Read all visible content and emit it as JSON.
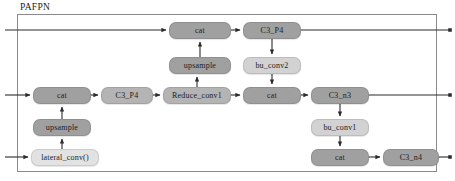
{
  "diagram": {
    "title": "PAFPN",
    "type": "neural-network-architecture",
    "frame": {
      "border_color": "#8a8a8a"
    },
    "palette": {
      "dark": "#a0a0a0",
      "mid": "#b4b4b4",
      "light": "#d2d2d2",
      "pale": "#e2e2e2",
      "wire": "#2b2b2b",
      "text": "#1c1c1c"
    },
    "nodes": [
      {
        "id": "cat_top",
        "label": "cat",
        "tone": "dark",
        "x": 169,
        "y": 22,
        "w": 62,
        "h": 17
      },
      {
        "id": "c3_p4_top",
        "label": "C3_P4",
        "tone": "dark",
        "x": 243,
        "y": 22,
        "w": 58,
        "h": 17
      },
      {
        "id": "upsample_top",
        "label": "upsample",
        "tone": "dark",
        "x": 169,
        "y": 57,
        "w": 62,
        "h": 17
      },
      {
        "id": "bu_conv2",
        "label": "bu_conv2",
        "tone": "light",
        "x": 243,
        "y": 57,
        "w": 58,
        "h": 17
      },
      {
        "id": "cat_mid_left",
        "label": "cat",
        "tone": "dark",
        "x": 33,
        "y": 87,
        "w": 58,
        "h": 17
      },
      {
        "id": "c3_p4_mid",
        "label": "C3_P4",
        "tone": "mid",
        "x": 101,
        "y": 87,
        "w": 52,
        "h": 17
      },
      {
        "id": "reduce_conv1",
        "label": "Reduce_conv1",
        "tone": "mid",
        "x": 163,
        "y": 87,
        "w": 68,
        "h": 17
      },
      {
        "id": "cat_mid_right",
        "label": "cat",
        "tone": "dark",
        "x": 243,
        "y": 87,
        "w": 58,
        "h": 17
      },
      {
        "id": "c3_n3",
        "label": "C3_n3",
        "tone": "dark",
        "x": 311,
        "y": 87,
        "w": 58,
        "h": 17
      },
      {
        "id": "upsample_low",
        "label": "upsample",
        "tone": "dark",
        "x": 33,
        "y": 119,
        "w": 58,
        "h": 17
      },
      {
        "id": "bu_conv1",
        "label": "bu_conv1",
        "tone": "light",
        "x": 311,
        "y": 119,
        "w": 58,
        "h": 17
      },
      {
        "id": "lateral_conv0",
        "label": "lateral_conv()",
        "tone": "pale",
        "x": 31,
        "y": 149,
        "w": 68,
        "h": 17
      },
      {
        "id": "cat_bottom",
        "label": "cat",
        "tone": "dark",
        "x": 311,
        "y": 149,
        "w": 58,
        "h": 17
      },
      {
        "id": "c3_n4",
        "label": "C3_n4",
        "tone": "dark",
        "x": 383,
        "y": 149,
        "w": 56,
        "h": 17
      }
    ],
    "flow_rows": [
      {
        "id": "row-top",
        "y": 30
      },
      {
        "id": "row-middle",
        "y": 95
      },
      {
        "id": "row-bottom",
        "y": 157
      }
    ],
    "edges": [
      {
        "id": "in-top",
        "from": "left-edge",
        "to": "cat_top",
        "direction": "right"
      },
      {
        "id": "cat-top-to-c3p4",
        "from": "cat_top",
        "to": "c3_p4_top",
        "direction": "right"
      },
      {
        "id": "c3p4-top-out",
        "from": "c3_p4_top",
        "to": "right-edge",
        "direction": "right"
      },
      {
        "id": "upsample-to-cat",
        "from": "upsample_top",
        "to": "cat_top",
        "direction": "up"
      },
      {
        "id": "reduce-to-upsample",
        "from": "reduce_conv1",
        "to": "upsample_top",
        "direction": "up"
      },
      {
        "id": "c3p4-to-buconv2",
        "from": "c3_p4_top",
        "to": "bu_conv2",
        "direction": "down"
      },
      {
        "id": "buconv2-to-cat",
        "from": "bu_conv2",
        "to": "cat_mid_right",
        "direction": "down"
      },
      {
        "id": "in-middle",
        "from": "left-edge",
        "to": "cat_mid_left",
        "direction": "right"
      },
      {
        "id": "cat-to-c3p4-mid",
        "from": "cat_mid_left",
        "to": "c3_p4_mid",
        "direction": "right"
      },
      {
        "id": "c3p4-to-reduce",
        "from": "c3_p4_mid",
        "to": "reduce_conv1",
        "direction": "right"
      },
      {
        "id": "reduce-to-cat",
        "from": "reduce_conv1",
        "to": "cat_mid_right",
        "direction": "right"
      },
      {
        "id": "cat-to-c3n3",
        "from": "cat_mid_right",
        "to": "c3_n3",
        "direction": "right"
      },
      {
        "id": "c3n3-out",
        "from": "c3_n3",
        "to": "right-edge",
        "direction": "right"
      },
      {
        "id": "upsample-to-catmid",
        "from": "upsample_low",
        "to": "cat_mid_left",
        "direction": "up"
      },
      {
        "id": "lateral-to-upsample",
        "from": "lateral_conv0",
        "to": "upsample_low",
        "direction": "up"
      },
      {
        "id": "in-bottom",
        "from": "left-edge",
        "to": "lateral_conv0",
        "direction": "right"
      },
      {
        "id": "c3n3-to-buconv1",
        "from": "c3_n3",
        "to": "bu_conv1",
        "direction": "down"
      },
      {
        "id": "buconv1-to-cat",
        "from": "bu_conv1",
        "to": "cat_bottom",
        "direction": "down"
      },
      {
        "id": "cat-to-c3n4",
        "from": "cat_bottom",
        "to": "c3_n4",
        "direction": "right"
      },
      {
        "id": "c3n4-out",
        "from": "c3_n4",
        "to": "right-edge",
        "direction": "right"
      }
    ]
  }
}
